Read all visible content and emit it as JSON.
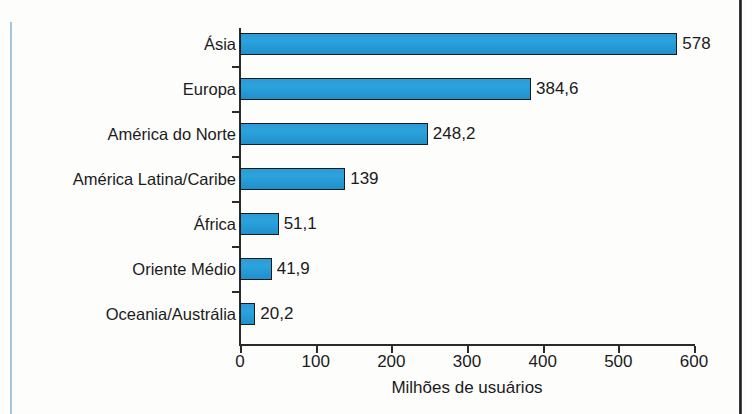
{
  "chart_data": {
    "type": "bar",
    "orientation": "horizontal",
    "title": "",
    "xlabel": "Milhões de usuários",
    "ylabel": "",
    "xlim": [
      0,
      600
    ],
    "xticks": [
      0,
      100,
      200,
      300,
      400,
      500,
      600
    ],
    "xtick_labels": [
      "0",
      "100",
      "200",
      "300",
      "400",
      "500",
      "600"
    ],
    "grid": false,
    "legend": null,
    "bar_color": "#2ba3dd",
    "bar_edge_color": "#1b1b1b",
    "categories": [
      "Ásia",
      "Europa",
      "América do Norte",
      "América Latina/Caribe",
      "África",
      "Oriente Médio",
      "Oceania/Austrália"
    ],
    "values": [
      578,
      384.6,
      248.2,
      139,
      51.1,
      41.9,
      20.2
    ],
    "value_labels": [
      "578",
      "384,6",
      "248,2",
      "139",
      "51,1",
      "41,9",
      "20,2"
    ]
  }
}
